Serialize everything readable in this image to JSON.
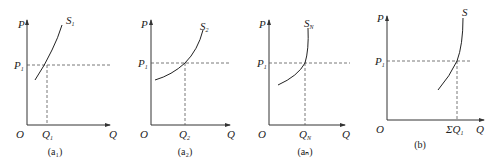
{
  "figure": {
    "panels": [
      {
        "id": "a1",
        "caption": "(a₁)",
        "y_label": "P",
        "x_label": "Q",
        "origin": "O",
        "price_label": "P",
        "price_sub": "1",
        "qty_label": "Q",
        "qty_sub": "1",
        "curve_label": "S",
        "curve_sub": "1"
      },
      {
        "id": "a2",
        "caption": "(a₂)",
        "y_label": "P",
        "x_label": "Q",
        "origin": "O",
        "price_label": "P",
        "price_sub": "1",
        "qty_label": "Q",
        "qty_sub": "2",
        "curve_label": "S",
        "curve_sub": "2"
      },
      {
        "id": "aN",
        "caption": "(aₙ)",
        "y_label": "P",
        "x_label": "Q",
        "origin": "O",
        "price_label": "P",
        "price_sub": "1",
        "qty_label": "Q",
        "qty_sub": "N",
        "curve_label": "S",
        "curve_sub": "N"
      },
      {
        "id": "b",
        "caption": "(b)",
        "y_label": "P",
        "x_label": "Q",
        "origin": "O",
        "price_label": "P",
        "price_sub": "1",
        "qty_label": "ΣQ",
        "qty_sub": "1",
        "curve_label": "S",
        "curve_sub": ""
      }
    ]
  }
}
